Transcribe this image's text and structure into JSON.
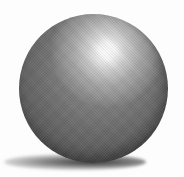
{
  "scene": {
    "subject": "shaded sphere",
    "colors": {
      "background": "#fdfdfd",
      "sphere_base": "#7a7a7a",
      "sphere_edge": "#333333",
      "highlight": "#ffffff",
      "shadow": "#1e1e1e"
    }
  }
}
